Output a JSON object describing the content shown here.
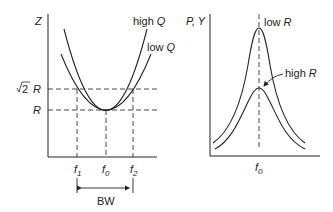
{
  "left_plot": {
    "y_axis_label": "Z",
    "curves": [
      {
        "name": "high-q",
        "label_text": "high",
        "label_var": "Q"
      },
      {
        "name": "low-q",
        "label_text": "low",
        "label_var": "Q"
      }
    ],
    "levels": {
      "sqrt2": "√2",
      "sqrt2_var": "R",
      "r_var": "R"
    },
    "x_ticks": [
      {
        "var": "f",
        "sub": "1"
      },
      {
        "var": "f",
        "sub": "0"
      },
      {
        "var": "f",
        "sub": "2"
      }
    ],
    "bandwidth_label": "BW"
  },
  "right_plot": {
    "y_axis_label": "P, Y",
    "curves": [
      {
        "name": "low-r",
        "label_text": "low",
        "label_var": "R"
      },
      {
        "name": "high-r",
        "label_text": "high",
        "label_var": "R"
      }
    ],
    "x_tick": {
      "var": "f",
      "sub": "0"
    }
  },
  "colors": {
    "line": "#222222",
    "background": "#ffffff"
  }
}
